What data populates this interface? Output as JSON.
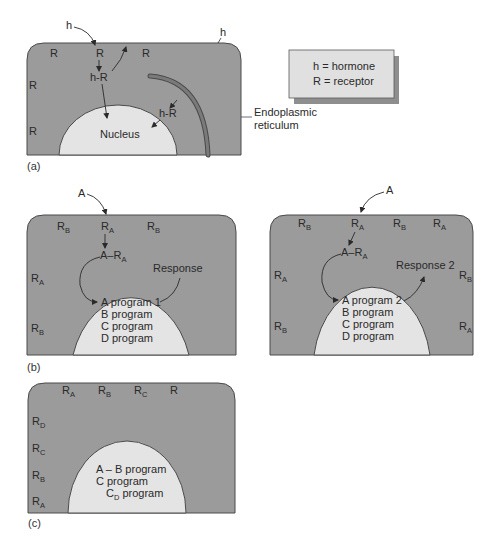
{
  "colors": {
    "cytoplasm": "#9b9b9b",
    "nucleus": "#e4e4e4",
    "outline": "#4a4a4a",
    "legend_bg": "#e0e0e0",
    "legend_shadow": "#8e8e8e",
    "er": "#7a7a7a",
    "text": "#2a2a2a"
  },
  "legend": {
    "line1": "h = hormone",
    "line2": "R = receptor"
  },
  "panel_a": {
    "tag": "(a)",
    "hormone_outside_1": "h",
    "hormone_outside_2": "h",
    "receptors": [
      "R",
      "R",
      "R",
      "R",
      "R"
    ],
    "complex_1": "h-R",
    "complex_2": "h-R",
    "nucleus_label": "Nucleus",
    "er_label_line1": "Endoplasmic",
    "er_label_line2": "reticulum"
  },
  "panel_b_left": {
    "tag": "(b)",
    "ligand": "A",
    "receptors_top": [
      {
        "main": "R",
        "sub": "B"
      },
      {
        "main": "R",
        "sub": "A"
      },
      {
        "main": "R",
        "sub": "B"
      }
    ],
    "receptors_side": [
      {
        "main": "R",
        "sub": "A"
      },
      {
        "main": "R",
        "sub": "B"
      }
    ],
    "complex": {
      "prefix": "A–R",
      "sub": "A"
    },
    "response": "Response",
    "programs": [
      "A program 1",
      "B program",
      "C program",
      "D program"
    ]
  },
  "panel_b_right": {
    "ligand": "A",
    "receptors_top": [
      {
        "main": "R",
        "sub": "B"
      },
      {
        "main": "R",
        "sub": "A"
      },
      {
        "main": "R",
        "sub": "B"
      },
      {
        "main": "R",
        "sub": "A"
      }
    ],
    "receptors_left": [
      {
        "main": "R",
        "sub": "A"
      },
      {
        "main": "R",
        "sub": "B"
      }
    ],
    "receptors_right": [
      {
        "main": "R",
        "sub": "B"
      },
      {
        "main": "R",
        "sub": "A"
      }
    ],
    "complex": {
      "prefix": "A–R",
      "sub": "A"
    },
    "response": "Response 2",
    "programs": [
      "A program 2",
      "B program",
      "C program",
      "D program"
    ]
  },
  "panel_c": {
    "tag": "(c)",
    "receptors_top": [
      {
        "main": "R",
        "sub": "A"
      },
      {
        "main": "R",
        "sub": "B"
      },
      {
        "main": "R",
        "sub": "C"
      },
      {
        "main": "R",
        "sub": ""
      }
    ],
    "receptors_side": [
      {
        "main": "R",
        "sub": "D"
      },
      {
        "main": "R",
        "sub": "C"
      },
      {
        "main": "R",
        "sub": "B"
      },
      {
        "main": "R",
        "sub": "A"
      }
    ],
    "programs": [
      {
        "text": "A – B program"
      },
      {
        "text": "C program"
      },
      {
        "main": "C",
        "sub": "D",
        "rest": " program"
      }
    ]
  }
}
